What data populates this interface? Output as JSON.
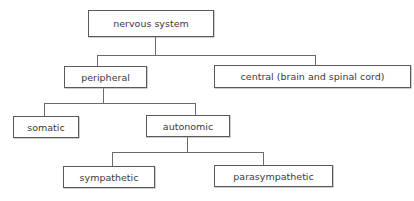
{
  "diagram": {
    "type": "hierarchy-tree",
    "root": {
      "label": "nervous system",
      "children": [
        {
          "label": "peripheral",
          "children": [
            {
              "label": "somatic"
            },
            {
              "label": "autonomic",
              "children": [
                {
                  "label": "sympathetic"
                },
                {
                  "label": "parasympathetic"
                }
              ]
            }
          ]
        },
        {
          "label": "central (brain and spinal cord)"
        }
      ]
    },
    "nodes": {
      "nervous_system": "nervous system",
      "peripheral": "peripheral",
      "central": "central (brain and spinal cord)",
      "somatic": "somatic",
      "autonomic": "autonomic",
      "sympathetic": "sympathetic",
      "parasympathetic": "parasympathetic"
    },
    "colors": {
      "border": "#5a5a5a",
      "connector": "#6a6a6a",
      "text": "#3a3a3a",
      "background": "#ffffff"
    }
  }
}
